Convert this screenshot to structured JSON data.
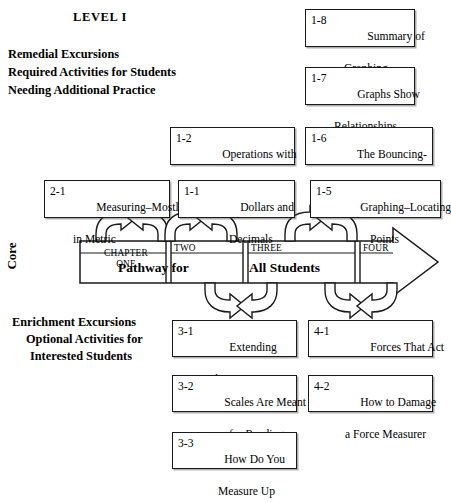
{
  "headings": {
    "level_title": "LEVEL I",
    "remedial": [
      "Remedial Excursions",
      "Required Activities for Students",
      "Needing Additional Practice"
    ],
    "enrichment": [
      "Enrichment Excursions",
      "Optional Activities for",
      "Interested Students"
    ]
  },
  "core_band": {
    "core_label": "Core",
    "chapter_one": "CHAPTER\nONE",
    "chapter_two": "TWO",
    "chapter_three": "THREE",
    "chapter_four": "FOUR",
    "pathway_word": "Pathway for",
    "students_word": "All Students"
  },
  "boxes": {
    "b18": {
      "num": "1-8",
      "line1": "Summary of",
      "line2": "Graphing"
    },
    "b17": {
      "num": "1-7",
      "line1": "Graphs Show",
      "line2": "Relationships"
    },
    "b12": {
      "num": "1-2",
      "line1": "Operations with",
      "line2": "Decimals"
    },
    "b16": {
      "num": "1-6",
      "line1": "The Bouncing-",
      "line2": "Ball Graph"
    },
    "b21": {
      "num": "2-1",
      "line1": "Measuring–Mostly",
      "line2": "in Metric"
    },
    "b11": {
      "num": "1-1",
      "line1": "Dollars and",
      "line2": "Decimals"
    },
    "b15": {
      "num": "1-5",
      "line1": "Graphing–Locating",
      "line2": "Points"
    },
    "b31": {
      "num": "3-1",
      "line1": "Extending",
      "line2": "the Senses"
    },
    "b41": {
      "num": "4-1",
      "line1": "Forces That Act",
      "line2": "at a Distance"
    },
    "b32": {
      "num": "3-2",
      "line1": "Scales Are Meant",
      "line2": "for Reading"
    },
    "b42": {
      "num": "4-2",
      "line1": "How to Damage",
      "line2": "a Force Measurer"
    },
    "b33": {
      "num": "3-3",
      "line1": "How Do You",
      "line2": "Measure Up"
    }
  },
  "colors": {
    "ink": "#1a1a1a",
    "paper": "#ffffff"
  }
}
